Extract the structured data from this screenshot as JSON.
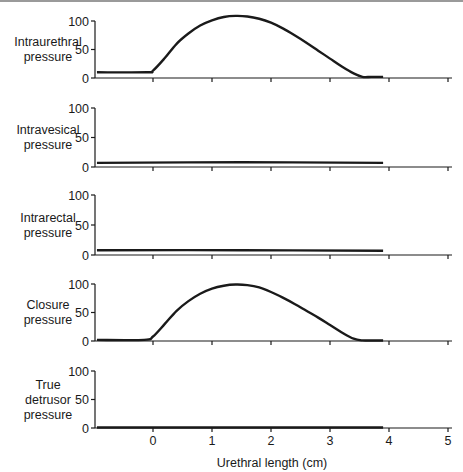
{
  "chart_data": {
    "type": "line",
    "title": "",
    "xlabel": "Urethral length (cm)",
    "x_ticks": [
      0,
      1,
      2,
      3,
      4,
      5
    ],
    "xlim": [
      -1,
      5.05
    ],
    "grid": false,
    "legend": null,
    "panels": [
      {
        "name": "intraurethral",
        "ylabel_lines": [
          "Intraurethral",
          "pressure"
        ],
        "yticks": [
          0,
          50,
          100
        ],
        "ylim": [
          0,
          100
        ],
        "series": {
          "x": [
            -0.95,
            -0.1,
            0.0,
            0.2,
            0.4,
            0.6,
            0.8,
            1.0,
            1.2,
            1.4,
            1.6,
            1.8,
            2.0,
            2.2,
            2.4,
            2.6,
            2.8,
            3.0,
            3.2,
            3.4,
            3.55,
            3.7,
            3.9
          ],
          "y": [
            10,
            10,
            13,
            35,
            60,
            78,
            92,
            101,
            107,
            109,
            108,
            104,
            97,
            87,
            75,
            62,
            48,
            34,
            20,
            8,
            2,
            2,
            2
          ]
        }
      },
      {
        "name": "intravesical",
        "ylabel_lines": [
          "Intravesical",
          "pressure"
        ],
        "yticks": [
          0,
          50,
          100
        ],
        "ylim": [
          0,
          100
        ],
        "series": {
          "x": [
            -0.95,
            1.5,
            3.9
          ],
          "y": [
            7,
            8,
            7
          ]
        }
      },
      {
        "name": "intrarectal",
        "ylabel_lines": [
          "Intrarectal",
          "pressure"
        ],
        "yticks": [
          0,
          50,
          100
        ],
        "ylim": [
          0,
          100
        ],
        "series": {
          "x": [
            -0.95,
            1.5,
            3.9
          ],
          "y": [
            8,
            8,
            7
          ]
        }
      },
      {
        "name": "closure",
        "ylabel_lines": [
          "Closure",
          "pressure"
        ],
        "yticks": [
          0,
          50,
          100
        ],
        "ylim": [
          0,
          100
        ],
        "series": {
          "x": [
            -0.95,
            -0.15,
            0.0,
            0.2,
            0.4,
            0.6,
            0.8,
            1.0,
            1.2,
            1.4,
            1.6,
            1.8,
            2.0,
            2.2,
            2.4,
            2.6,
            2.8,
            3.0,
            3.2,
            3.4,
            3.55,
            3.7,
            3.9
          ],
          "y": [
            2,
            2,
            8,
            30,
            53,
            70,
            83,
            92,
            97,
            99,
            98,
            94,
            86,
            76,
            65,
            53,
            41,
            28,
            15,
            4,
            1,
            1,
            1
          ]
        }
      },
      {
        "name": "true-detrusor",
        "ylabel_lines": [
          "True",
          "detrusor",
          "pressure"
        ],
        "yticks": [
          0,
          50,
          100
        ],
        "ylim": [
          0,
          100
        ],
        "series": {
          "x": [
            -0.95,
            3.9
          ],
          "y": [
            1,
            1
          ]
        }
      }
    ]
  },
  "layout": {
    "y_axis_x": 95,
    "x_axis_end": 452,
    "px_per_cm": 59,
    "x_zero_px": 153,
    "panels_px": [
      {
        "y100": 21,
        "y0": 78
      },
      {
        "y100": 108,
        "y0": 167
      },
      {
        "y100": 195,
        "y0": 255
      },
      {
        "y100": 284,
        "y0": 341
      },
      {
        "y100": 371,
        "y0": 428
      }
    ],
    "label_center_x": 48
  },
  "colors": {
    "ink": "#1a1a1a",
    "background": "#ffffff",
    "top_rule": "#9a9a9a"
  }
}
